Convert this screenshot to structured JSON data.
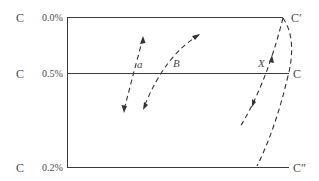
{
  "diagram": {
    "rows": [
      {
        "letter": "C",
        "percent": "0.0%",
        "right_label": "C′"
      },
      {
        "letter": "C",
        "percent": "0.5%",
        "right_label": "C"
      },
      {
        "letter": "C",
        "percent": "0.2%",
        "right_label": "C″"
      }
    ],
    "curve_labels": {
      "a": "a",
      "b": "B",
      "x": "X"
    },
    "colors": {
      "line": "#3a3a3a",
      "text": "#4a4a4a",
      "background": "#ffffff"
    }
  }
}
